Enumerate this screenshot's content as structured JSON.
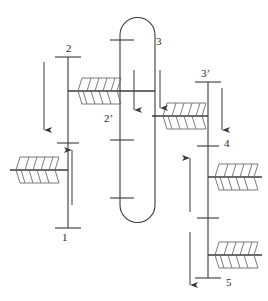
{
  "figure": {
    "kind": "process-flow-schematic",
    "stroke_color": "#3a3a3a",
    "hatch_color": "#6b6b6b",
    "background_color": "#ffffff",
    "corner_mark": "",
    "labels": [
      {
        "id": "label-1",
        "text": "1",
        "x": 62,
        "y": 232
      },
      {
        "id": "label-2",
        "text": "2",
        "x": 66,
        "y": 47
      },
      {
        "id": "label-2p",
        "text": "2’",
        "x": 104,
        "y": 115
      },
      {
        "id": "label-3",
        "text": "3",
        "x": 156,
        "y": 40
      },
      {
        "id": "label-3p",
        "text": "3’",
        "x": 201,
        "y": 72
      },
      {
        "id": "label-4",
        "text": "4",
        "x": 224,
        "y": 142
      },
      {
        "id": "label-5",
        "text": "5",
        "x": 226,
        "y": 282
      }
    ],
    "trunks": [
      {
        "id": "trunk-left",
        "x": 68,
        "y_top": 57,
        "y_bottom": 228,
        "top_tick": true,
        "bottom_tick": true,
        "mid_tick_y": 143
      },
      {
        "id": "trunk-right",
        "x": 208,
        "y_top": 82,
        "y_bottom": 278,
        "top_tick": true,
        "bottom_tick": true,
        "mid_tick_y": 218
      },
      {
        "id": "vessel-center",
        "x_left": 120,
        "x_right": 155,
        "y_top": 18,
        "y_bottom": 228,
        "cap_radius": 17
      }
    ],
    "vessel_internal_ticks": [
      {
        "id": "vessel-tick-top",
        "y": 40,
        "x_from": 110,
        "x_to": 134
      },
      {
        "id": "vessel-tick-middle",
        "y": 140,
        "x_from": 110,
        "x_to": 134
      },
      {
        "id": "vessel-tick-bottom",
        "y": 198,
        "x_from": 110,
        "x_to": 134
      }
    ],
    "branches": [
      {
        "id": "branch-2prime",
        "y": 91,
        "x_from": 68,
        "x_to": 155,
        "exchanger_x": 78,
        "exchanger_w": 40
      },
      {
        "id": "branch-1",
        "y": 170,
        "x_from": 10,
        "x_to": 68,
        "exchanger_x": 16,
        "exchanger_w": 40
      },
      {
        "id": "branch-3prime",
        "y": 116,
        "x_from": 152,
        "x_to": 208,
        "exchanger_x": 163,
        "exchanger_w": 40
      },
      {
        "id": "branch-4",
        "y": 177,
        "x_from": 208,
        "x_to": 262,
        "exchanger_x": 215,
        "exchanger_w": 40
      },
      {
        "id": "branch-5",
        "y": 255,
        "x_from": 208,
        "x_to": 262,
        "exchanger_x": 215,
        "exchanger_w": 40
      }
    ],
    "arrows": [
      {
        "id": "arrow-left-down",
        "x": 44,
        "y_from": 62,
        "y_to": 130,
        "direction": "down"
      },
      {
        "id": "arrow-left-up",
        "x": 72,
        "y_from": 205,
        "y_to": 150,
        "direction": "up"
      },
      {
        "id": "arrow-vessel-inner",
        "x": 134,
        "y_from": 70,
        "y_to": 110,
        "direction": "down"
      },
      {
        "id": "arrow-vessel-outer",
        "x": 160,
        "y_from": 70,
        "y_to": 108,
        "direction": "down"
      },
      {
        "id": "arrow-right-top-down",
        "x": 222,
        "y_from": 88,
        "y_to": 130,
        "direction": "down"
      },
      {
        "id": "arrow-right-up",
        "x": 190,
        "y_from": 212,
        "y_to": 158,
        "direction": "up"
      },
      {
        "id": "arrow-right-down",
        "x": 190,
        "y_from": 232,
        "y_to": 285,
        "direction": "down"
      }
    ],
    "exchanger_symbol": {
      "name": "hatched-exchanger-pair",
      "upper_slant": "right",
      "lower_slant": "left",
      "hatch_line_count": 4,
      "box_height": 13
    }
  }
}
